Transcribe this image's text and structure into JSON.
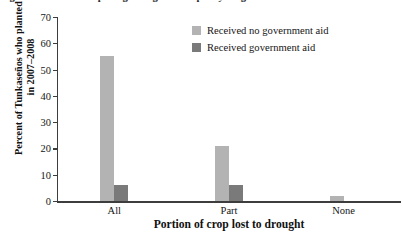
{
  "caption": {
    "text": "Figure 5. Effects of a pro-ag drought relief policy on government aid in Tunkas"
  },
  "chart_data": {
    "type": "bar",
    "title": "",
    "xlabel": "Portion of crop lost to drought",
    "ylabel": "Percent of Tunkaseños who planted crop in 2007–2008",
    "categories": [
      "All",
      "Part",
      "None"
    ],
    "series": [
      {
        "name": "Received no government aid",
        "color": "#b3b3b3",
        "values": [
          55,
          21,
          2
        ]
      },
      {
        "name": "Received government aid",
        "color": "#7a7a7a",
        "values": [
          6,
          6,
          0
        ]
      }
    ],
    "ylim": [
      0,
      70
    ],
    "yticks": [
      0,
      10,
      20,
      30,
      40,
      50,
      60,
      70
    ],
    "ytick_labels": [
      "0",
      "10",
      "20",
      "30",
      "40",
      "50",
      "60",
      "70"
    ],
    "grid": false,
    "legend_position": "top-center"
  }
}
